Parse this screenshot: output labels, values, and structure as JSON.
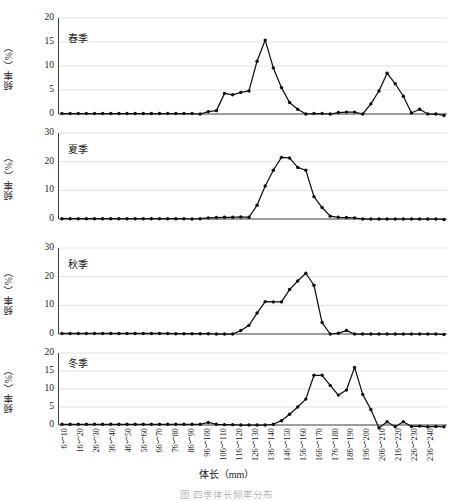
{
  "figure": {
    "xlabel": "体长（mm）",
    "ylabel": "频率（%）",
    "caption": "图  四季体长频率分布",
    "grid": true,
    "legend": "none",
    "line_color": "#111111",
    "grid_color": "#d4d4d4",
    "axis_color": "#3c3c3c"
  },
  "categories": [
    "6～10",
    "16～20",
    "26～30",
    "36～40",
    "46～50",
    "56～60",
    "66～70",
    "76～80",
    "86～90",
    "96～100",
    "106～110",
    "116～120",
    "126～130",
    "136～140",
    "146～150",
    "156～160",
    "166～170",
    "176～180",
    "186～190",
    "196～200",
    "206～210",
    "216～220",
    "226～230",
    "236～240"
  ],
  "chart_data": [
    {
      "type": "line",
      "title": "春季",
      "xlabel": "体长（mm）",
      "ylabel": "频率（%）",
      "ylim": [
        0,
        20
      ],
      "yticks": [
        0,
        5,
        10,
        15,
        20
      ],
      "categories": [
        "6～10",
        "16～20",
        "26～30",
        "36～40",
        "46～50",
        "56～60",
        "66～70",
        "76～80",
        "86～90",
        "96～100",
        "106～110",
        "116～120",
        "126～130",
        "136～140",
        "146～150",
        "156～160",
        "166～170",
        "176～180",
        "186～190",
        "196～200",
        "206～210",
        "216～220",
        "226～230",
        "236～240"
      ],
      "x": [
        6,
        11,
        16,
        21,
        26,
        31,
        36,
        41,
        46,
        51,
        56,
        61,
        66,
        71,
        76,
        81,
        86,
        91,
        96,
        101,
        106,
        111,
        116,
        121,
        126,
        131,
        136,
        141,
        146,
        151,
        156,
        161,
        166,
        171,
        176,
        181,
        186,
        191,
        196,
        201,
        206,
        211,
        216,
        221,
        226,
        231,
        236,
        241
      ],
      "values": [
        0.1,
        0.1,
        0.1,
        0.1,
        0.1,
        0.1,
        0.1,
        0.1,
        0.1,
        0.1,
        0.1,
        0.1,
        0.1,
        0.1,
        0.1,
        0.1,
        0.1,
        0.0,
        0.5,
        0.7,
        4.3,
        4.0,
        4.5,
        4.8,
        11.0,
        15.4,
        9.6,
        5.5,
        2.4,
        1.0,
        0.0,
        0.1,
        0.1,
        0.0,
        0.3,
        0.4,
        0.4,
        0.0,
        2.1,
        4.8,
        8.5,
        6.3,
        3.7,
        0.2,
        1.0,
        0.0,
        0.0,
        -0.3
      ],
      "grid": true
    },
    {
      "type": "line",
      "title": "夏季",
      "xlabel": "体长（mm）",
      "ylabel": "频率（%）",
      "ylim": [
        0,
        30
      ],
      "yticks": [
        0,
        10,
        20,
        30
      ],
      "categories": [
        "6～10",
        "16～20",
        "26～30",
        "36～40",
        "46～50",
        "56～60",
        "66～70",
        "76～80",
        "86～90",
        "96～100",
        "106～110",
        "116～120",
        "126～130",
        "136～140",
        "146～150",
        "156～160",
        "166～170",
        "176～180",
        "186～190",
        "196～200",
        "206～210",
        "216～220",
        "226～230",
        "236～240"
      ],
      "x": [
        6,
        11,
        16,
        21,
        26,
        31,
        36,
        41,
        46,
        51,
        56,
        61,
        66,
        71,
        76,
        81,
        86,
        91,
        96,
        101,
        106,
        111,
        116,
        121,
        126,
        131,
        136,
        141,
        146,
        151,
        156,
        161,
        166,
        171,
        176,
        181,
        186,
        191,
        196,
        201,
        206,
        211,
        216,
        221,
        226,
        231,
        236,
        241
      ],
      "values": [
        0.1,
        0.1,
        0.1,
        0.1,
        0.1,
        0.1,
        0.1,
        0.1,
        0.1,
        0.1,
        0.1,
        0.1,
        0.1,
        0.1,
        0.1,
        0.1,
        0.0,
        0.1,
        0.4,
        0.5,
        0.6,
        0.6,
        0.7,
        0.6,
        4.8,
        11.5,
        17.0,
        21.5,
        21.3,
        18.0,
        17.0,
        7.8,
        4.0,
        1.0,
        0.6,
        0.5,
        0.4,
        0.0,
        0.0,
        0.0,
        0.0,
        0.0,
        0.0,
        0.0,
        0.0,
        0.0,
        0.0,
        -0.2
      ],
      "grid": true
    },
    {
      "type": "line",
      "title": "秋季",
      "xlabel": "体长（mm）",
      "ylabel": "频率（%）",
      "ylim": [
        0,
        30
      ],
      "yticks": [
        0,
        10,
        20,
        30
      ],
      "categories": [
        "6～10",
        "16～20",
        "26～30",
        "36～40",
        "46～50",
        "56～60",
        "66～70",
        "76～80",
        "86～90",
        "96～100",
        "106～110",
        "116～120",
        "126～130",
        "136～140",
        "146～150",
        "156～160",
        "166～170",
        "176～180",
        "186～190",
        "196～200",
        "206～210",
        "216～220",
        "226～230",
        "236～240"
      ],
      "x": [
        6,
        11,
        16,
        21,
        26,
        31,
        36,
        41,
        46,
        51,
        56,
        61,
        66,
        71,
        76,
        81,
        86,
        91,
        96,
        101,
        106,
        111,
        116,
        121,
        126,
        131,
        136,
        141,
        146,
        151,
        156,
        161,
        166,
        171,
        176,
        181,
        186,
        191,
        196,
        201,
        206,
        211,
        216,
        221,
        226,
        231,
        236,
        241
      ],
      "values": [
        0.2,
        0.2,
        0.2,
        0.2,
        0.2,
        0.2,
        0.2,
        0.2,
        0.2,
        0.2,
        0.2,
        0.2,
        0.2,
        0.2,
        0.1,
        0.1,
        0.1,
        0.1,
        0.1,
        0.0,
        0.0,
        0.0,
        1.2,
        3.0,
        7.3,
        11.3,
        11.2,
        11.2,
        15.5,
        18.5,
        21.2,
        17.0,
        4.0,
        0.0,
        0.3,
        1.2,
        0.0,
        0.0,
        0.0,
        0.0,
        0.0,
        0.0,
        0.0,
        0.0,
        0.0,
        0.0,
        0.0,
        -0.2
      ],
      "grid": true
    },
    {
      "type": "line",
      "title": "冬季",
      "xlabel": "体长（mm）",
      "ylabel": "频率（%）",
      "ylim": [
        0,
        20
      ],
      "yticks": [
        0,
        5,
        10,
        15,
        20
      ],
      "categories": [
        "6～10",
        "16～20",
        "26～30",
        "36～40",
        "46～50",
        "56～60",
        "66～70",
        "76～80",
        "86～90",
        "96～100",
        "106～110",
        "116～120",
        "126～130",
        "136～140",
        "146～150",
        "156～160",
        "166～170",
        "176～180",
        "186～190",
        "196～200",
        "206～210",
        "216～220",
        "226～230",
        "236～240"
      ],
      "x": [
        6,
        11,
        16,
        21,
        26,
        31,
        36,
        41,
        46,
        51,
        56,
        61,
        66,
        71,
        76,
        81,
        86,
        91,
        96,
        101,
        106,
        111,
        116,
        121,
        126,
        131,
        136,
        141,
        146,
        151,
        156,
        161,
        166,
        171,
        176,
        181,
        186,
        191,
        196,
        201,
        206,
        211,
        216,
        221,
        226,
        231,
        236,
        241
      ],
      "values": [
        0.2,
        0.2,
        0.2,
        0.2,
        0.2,
        0.2,
        0.2,
        0.2,
        0.2,
        0.2,
        0.2,
        0.2,
        0.2,
        0.2,
        0.2,
        0.2,
        0.2,
        0.2,
        0.7,
        0.2,
        0.1,
        0.1,
        0.0,
        0.0,
        0.0,
        0.0,
        0.2,
        1.2,
        3.0,
        5.0,
        7.2,
        13.8,
        13.8,
        11.0,
        8.3,
        9.7,
        16.0,
        8.5,
        4.3,
        -0.8,
        0.9,
        -0.5,
        0.9,
        -0.4,
        -0.3,
        -0.5,
        -0.4,
        -0.5
      ],
      "grid": true
    }
  ]
}
